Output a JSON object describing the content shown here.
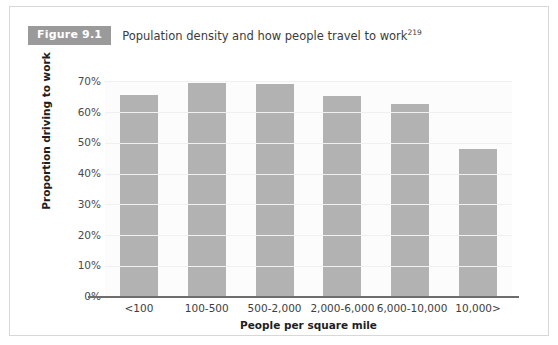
{
  "figure": {
    "badge_label": "Figure 9.1",
    "caption": "Population density and how people travel to work",
    "caption_reference": "219"
  },
  "chart_data": {
    "type": "bar",
    "title": "Population density and how people travel to work",
    "categories": [
      "<100",
      "100-500",
      "500-2,000",
      "2,000-6,000",
      "6,000-10,000",
      "10,000>"
    ],
    "values": [
      65.5,
      69.5,
      69,
      65,
      62.5,
      48
    ],
    "xlabel": "People per square mile",
    "ylabel": "Proportion driving to work",
    "ylim": [
      0,
      70
    ],
    "ytick_labels": [
      "70%",
      "60%",
      "50%",
      "40%",
      "30%",
      "20%",
      "10%",
      "0%"
    ],
    "ytick_values": [
      70,
      60,
      50,
      40,
      30,
      20,
      10,
      0
    ],
    "grid": false,
    "legend": "none",
    "bar_color": "#b2b2b2",
    "badge_color": "#9a9a9a",
    "axis_color": "#6d6d6d"
  }
}
